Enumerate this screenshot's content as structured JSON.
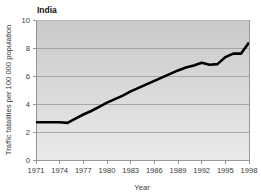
{
  "chart_data": {
    "type": "line",
    "title": "India",
    "xlabel": "Year",
    "ylabel": "Traffic fatalities per 100 000 population",
    "xlim": [
      1971,
      1998
    ],
    "ylim": [
      0,
      10
    ],
    "grid": true,
    "legend": "none",
    "xticks": [
      "1971",
      "1974",
      "1977",
      "1980",
      "1983",
      "1986",
      "1989",
      "1992",
      "1995",
      "1998"
    ],
    "xtick_values": [
      1971,
      1974,
      1977,
      1980,
      1983,
      1986,
      1989,
      1992,
      1995,
      1998
    ],
    "yticks": [
      "0",
      "2",
      "4",
      "6",
      "8",
      "10"
    ],
    "ytick_values": [
      0,
      2,
      4,
      6,
      8,
      10
    ],
    "series": [
      {
        "name": "India",
        "color": "#000000",
        "x": [
          1971,
          1972,
          1973,
          1974,
          1975,
          1976,
          1977,
          1978,
          1979,
          1980,
          1981,
          1982,
          1983,
          1984,
          1985,
          1986,
          1987,
          1988,
          1989,
          1990,
          1991,
          1992,
          1993,
          1994,
          1995,
          1996,
          1997,
          1998
        ],
        "values": [
          2.7,
          2.7,
          2.7,
          2.7,
          2.65,
          2.95,
          3.25,
          3.5,
          3.8,
          4.1,
          4.35,
          4.6,
          4.9,
          5.15,
          5.4,
          5.65,
          5.9,
          6.15,
          6.4,
          6.6,
          6.75,
          6.95,
          6.8,
          6.85,
          7.35,
          7.6,
          7.6,
          8.4
        ]
      }
    ]
  },
  "style": {
    "plot_bg_top": "#c9c9c9",
    "plot_bg_bottom": "#eaeaea",
    "grid_color": "#9a9a9a",
    "axis_color": "#8c8c8c",
    "text_color": "#3a3a3a",
    "line_color": "#000000",
    "page_bg": "#ffffff"
  }
}
